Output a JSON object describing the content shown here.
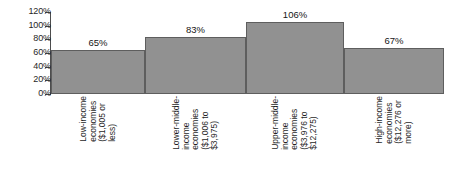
{
  "chart_data": {
    "type": "bar",
    "title": "",
    "subtitle": "",
    "xlabel": "",
    "ylabel": "",
    "ylim": [
      0,
      120
    ],
    "grid": false,
    "legend": false,
    "orientation": "vertical",
    "bar_gap": "none",
    "colors": {
      "bar_fill": "#919191",
      "bar_border": "#5e5e5e",
      "axis": "#4d4d4d",
      "text": "#1f1f1f",
      "background": "#ffffff"
    },
    "y_ticks": [
      "0%",
      "20%",
      "40%",
      "60%",
      "80%",
      "100%",
      "120%"
    ],
    "y_tick_values": [
      0,
      20,
      40,
      60,
      80,
      100,
      120
    ],
    "categories": [
      "Low-income economies ($1,005 or less)",
      "Lower-middle-income economies ($1,006 to $3,975)",
      "Upper-middle-income economies ($3,976 to $12,275)",
      "High-income economies ($12,276 or more)"
    ],
    "category_lines": [
      [
        "Low-income",
        "economies",
        "($1,005 or",
        "less)"
      ],
      [
        "Lower-middle-",
        "income",
        "economies",
        "($1,006 to",
        "$3,975)"
      ],
      [
        "Upper-middle-",
        "income",
        "economies",
        "($3,976 to",
        "$12,275)"
      ],
      [
        "High-income",
        "economies",
        "($12,276 or",
        "more)"
      ]
    ],
    "values": [
      65,
      83,
      106,
      67
    ],
    "value_labels": [
      "65%",
      "83%",
      "106%",
      "67%"
    ]
  }
}
